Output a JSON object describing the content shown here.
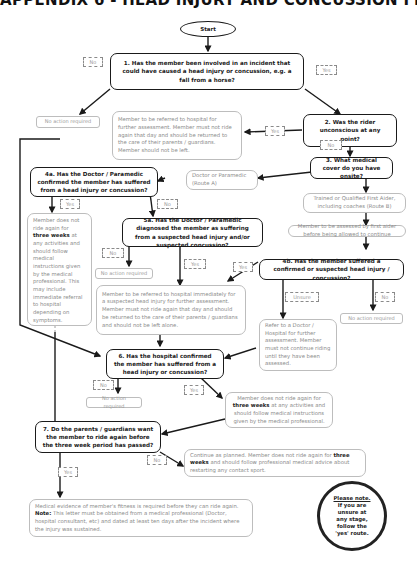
{
  "title": "APPENDIX 6 - HEAD INJURY AND CONCUSSION FLOWCHART",
  "start": "Start",
  "questions": {
    "q1": "1. Has the member been involved in an incident that could have caused a head injury or concussion, e.g. a fall from a horse?",
    "q2": "2. Was the rider unconscious at any point?",
    "q3": "3. What medical cover do you have onsite?",
    "q4a": "4a. Has the Doctor / Paramedic confirmed the member has suffered from a head injury or concussion?",
    "q4b": "4b. Has the member suffered a confirmed or suspected head injury / concussion?",
    "q5a": "5a. Has the Doctor / Paramedic diagnosed the member as suffering from a suspected head injury and/or suspected concussion?",
    "q6": "6. Has the hospital confirmed the member has suffered from a head injury or concussion?",
    "q7": "7. Do the parents / guardians want the member to ride again before the three week period has passed?"
  },
  "outcomes": {
    "no_action_1": "No action required",
    "refer_hospital_q2": "Member to be referred to hospital for further assessment. Member must not ride again that day and should be returned to the care of their parents / guardians. Member should not be left.",
    "route_a": "Doctor or Paramedic (Route A)",
    "route_b": "Trained or Qualified First Aider, including coaches (Route B)",
    "assess_first_aider": "Member to be assessed by first aider before being allowed to continue",
    "four_a_yes_pre": "Member does not ride again for ",
    "four_a_yes_bold": "three weeks",
    "four_a_yes_post": " at any activities and should follow medical instructions given by the medical professional. This may include immediate referral to hospital depending on symptoms.",
    "no_action_5a": "No action required",
    "refer_hospital_5a": "Member to be referred to hospital immediately for a suspected head injury for further assessment. Member must not ride again that day and should be returned to the care of their parents / guardians and should not be left alone.",
    "refer_doctor_unsure": "Refer to a Doctor / Hospital for further assessment. Member must not continue riding until they have been assessed.",
    "no_action_4b": "No action required",
    "no_action_6": "No action required",
    "six_yes_pre": "Member does not ride again for ",
    "six_yes_bold": "three weeks",
    "six_yes_post": " at any activities and should follow medical instructions given by the medical professional.",
    "seven_no_pre": "Continue as planned.  Member does not ride again for ",
    "seven_no_bold": "three weeks",
    "seven_no_post": " and should follow professional medical advice about restarting any contact sport.",
    "seven_yes_line1": "Medical evidence of member's fitness is required before they can ride again.",
    "seven_yes_note_label": "Note:",
    "seven_yes_note": " This letter must be obtained from a medical professional (Doctor, hospital consultant, etc) and dated at least ten days after the incident where the injury was sustained."
  },
  "labels": {
    "q1_no": "No",
    "q1_yes": "Yes",
    "q2_yes": "Yes",
    "q2_no": "No",
    "q4a_yes": "Yes",
    "q4a_no": "No",
    "q5a_no": "No",
    "q5a_yes": "Yes",
    "q4b_yes": "Yes",
    "q4b_unsure": "Unsure",
    "q4b_no": "No",
    "q6_no": "No",
    "q6_yes": "Yes",
    "q7_no": "No",
    "q7_yes": "Yes"
  },
  "note": {
    "heading": "Please note.",
    "lines": [
      "If you are",
      "unsure at",
      "any stage,",
      "follow the",
      "'yes' route."
    ]
  }
}
